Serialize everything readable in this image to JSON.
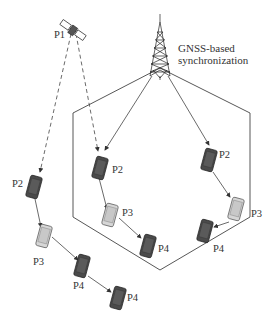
{
  "diagram": {
    "annotation": {
      "line1": "GNSS-based",
      "line2": "synchronization"
    },
    "nodes": {
      "satellite": {
        "label": "P1",
        "icon": "satellite-icon"
      },
      "tower": {
        "icon": "cell-tower-icon"
      },
      "outside_chain": [
        {
          "label": "P2",
          "shade": "dark"
        },
        {
          "label": "P3",
          "shade": "light"
        },
        {
          "label": "P4",
          "shade": "dark"
        },
        {
          "label": "P4",
          "shade": "dark"
        }
      ],
      "inside_left_chain": [
        {
          "label": "P2",
          "shade": "dark"
        },
        {
          "label": "P3",
          "shade": "light"
        },
        {
          "label": "P4",
          "shade": "dark"
        }
      ],
      "inside_right_chain": [
        {
          "label": "P2",
          "shade": "dark"
        },
        {
          "label": "P3",
          "shade": "light"
        },
        {
          "label": "P4",
          "shade": "dark"
        }
      ]
    },
    "colors": {
      "dark_phone": "#4a4a4a",
      "light_phone": "#cfcfcf",
      "line": "#333333"
    }
  }
}
